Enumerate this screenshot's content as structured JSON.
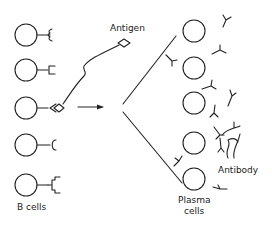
{
  "diagram": {
    "labels": {
      "antigen": "Antigen",
      "b_cells": "B cells",
      "plasma_line1": "Plasma",
      "plasma_line2": "cells",
      "antibody": "Antibody"
    },
    "b_cells": [
      {
        "id": 1,
        "receptor": "forked-curly",
        "cy": 35
      },
      {
        "id": 2,
        "receptor": "square-cup",
        "cy": 70
      },
      {
        "id": 3,
        "receptor": "diamond-cup",
        "cy": 108,
        "bound_antigen": true
      },
      {
        "id": 4,
        "receptor": "round-cup",
        "cy": 145
      },
      {
        "id": 5,
        "receptor": "branched-square",
        "cy": 185
      }
    ],
    "plasma_cells": [
      {
        "id": 1,
        "cy": 31
      },
      {
        "id": 2,
        "cy": 68
      },
      {
        "id": 3,
        "cy": 103
      },
      {
        "id": 4,
        "cy": 143
      },
      {
        "id": 5,
        "cy": 179
      }
    ],
    "colors": {
      "line": "#222222",
      "background": "#ffffff"
    }
  }
}
